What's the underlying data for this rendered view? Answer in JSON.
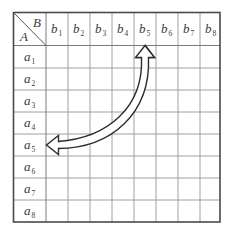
{
  "table": {
    "corner": {
      "top_right_label": "B",
      "bottom_left_label": "A"
    },
    "column_headers": [
      {
        "base": "b",
        "sub": "1"
      },
      {
        "base": "b",
        "sub": "2"
      },
      {
        "base": "b",
        "sub": "3"
      },
      {
        "base": "b",
        "sub": "4"
      },
      {
        "base": "b",
        "sub": "5"
      },
      {
        "base": "b",
        "sub": "6"
      },
      {
        "base": "b",
        "sub": "7"
      },
      {
        "base": "b",
        "sub": "8"
      }
    ],
    "row_headers": [
      {
        "base": "a",
        "sub": "1"
      },
      {
        "base": "a",
        "sub": "2"
      },
      {
        "base": "a",
        "sub": "3"
      },
      {
        "base": "a",
        "sub": "4"
      },
      {
        "base": "a",
        "sub": "5"
      },
      {
        "base": "a",
        "sub": "6"
      },
      {
        "base": "a",
        "sub": "7"
      },
      {
        "base": "a",
        "sub": "8"
      }
    ]
  },
  "arrow": {
    "type": "double-headed-hollow-arrow",
    "from": "b5 column header",
    "to": "a5 row header"
  },
  "colors": {
    "grid_line": "#9a9a9a",
    "border": "#4a4a4a",
    "text": "#3a3a3a",
    "arrow_stroke": "#2e2e2e"
  }
}
